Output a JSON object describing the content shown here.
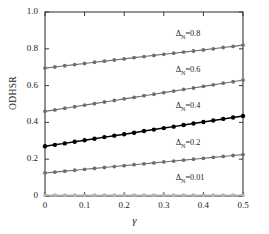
{
  "chart_data": {
    "type": "line",
    "title": "",
    "xlabel": "γ",
    "ylabel": "ODHSR",
    "xlim": [
      0,
      0.5
    ],
    "ylim": [
      0,
      1.0
    ],
    "xticks": [
      "0",
      "0.1",
      "0.2",
      "0.3",
      "0.4",
      "0.5"
    ],
    "xtick_values": [
      0,
      0.1,
      0.2,
      0.3,
      0.4,
      0.5
    ],
    "yticks": [
      "0",
      "0.2",
      "0.4",
      "0.6",
      "0.8",
      "1.0"
    ],
    "ytick_values": [
      0,
      0.2,
      0.4,
      0.6,
      0.8,
      1.0
    ],
    "grid": false,
    "legend_position": "inline-annotations",
    "marker": "filled-circle",
    "x": [
      0,
      0.025,
      0.05,
      0.075,
      0.1,
      0.125,
      0.15,
      0.175,
      0.2,
      0.225,
      0.25,
      0.275,
      0.3,
      0.325,
      0.35,
      0.375,
      0.4,
      0.425,
      0.45,
      0.475,
      0.5
    ],
    "series": [
      {
        "name": "ΔN=0.8",
        "label_main": "Δ",
        "label_sub": "N",
        "label_value": "=0.8",
        "color": "#6e6e6e",
        "values": [
          0.695,
          0.701,
          0.708,
          0.714,
          0.72,
          0.727,
          0.733,
          0.739,
          0.745,
          0.752,
          0.758,
          0.764,
          0.77,
          0.776,
          0.782,
          0.788,
          0.794,
          0.8,
          0.807,
          0.813,
          0.82
        ]
      },
      {
        "name": "ΔN=0.6",
        "label_main": "Δ",
        "label_sub": "N",
        "label_value": "=0.6",
        "color": "#6e6e6e",
        "values": [
          0.46,
          0.468,
          0.477,
          0.485,
          0.494,
          0.502,
          0.511,
          0.519,
          0.528,
          0.536,
          0.545,
          0.553,
          0.562,
          0.57,
          0.579,
          0.587,
          0.596,
          0.604,
          0.613,
          0.621,
          0.63
        ]
      },
      {
        "name": "ΔN=0.4",
        "label_main": "Δ",
        "label_sub": "N",
        "label_value": "=0.4",
        "color": "#000000",
        "values": [
          0.27,
          0.278,
          0.286,
          0.295,
          0.303,
          0.311,
          0.32,
          0.328,
          0.336,
          0.344,
          0.353,
          0.361,
          0.369,
          0.377,
          0.386,
          0.394,
          0.402,
          0.41,
          0.419,
          0.427,
          0.435
        ]
      },
      {
        "name": "ΔN=0.2",
        "label_main": "Δ",
        "label_sub": "N",
        "label_value": "=0.2",
        "color": "#6e6e6e",
        "values": [
          0.125,
          0.13,
          0.135,
          0.14,
          0.145,
          0.15,
          0.155,
          0.16,
          0.165,
          0.17,
          0.175,
          0.18,
          0.185,
          0.19,
          0.195,
          0.2,
          0.205,
          0.21,
          0.215,
          0.22,
          0.225
        ]
      },
      {
        "name": "ΔN=0.01",
        "label_main": "Δ",
        "label_sub": "N",
        "label_value": "=0.01",
        "color": "#b4b4b4",
        "values": [
          0.005,
          0.005,
          0.005,
          0.005,
          0.005,
          0.005,
          0.005,
          0.005,
          0.005,
          0.005,
          0.005,
          0.005,
          0.005,
          0.005,
          0.005,
          0.005,
          0.005,
          0.005,
          0.005,
          0.005,
          0.005
        ]
      }
    ],
    "annotations": [
      {
        "text": "ΔN=0.8",
        "x": 0.33,
        "y": 0.875
      },
      {
        "text": "ΔN=0.6",
        "x": 0.33,
        "y": 0.68
      },
      {
        "text": "ΔN=0.4",
        "x": 0.33,
        "y": 0.485
      },
      {
        "text": "ΔN=0.2",
        "x": 0.33,
        "y": 0.285
      },
      {
        "text": "ΔN=0.01",
        "x": 0.33,
        "y": 0.095
      }
    ]
  },
  "axis_colors": {
    "frame": "#3a3a3a",
    "text": "#1a1a1a"
  }
}
